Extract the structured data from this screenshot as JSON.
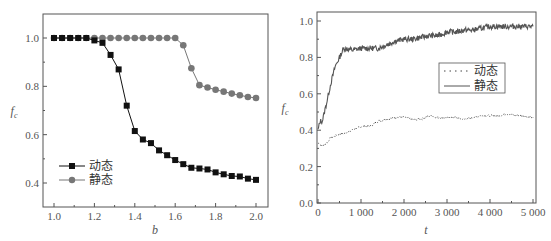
{
  "chart_data": [
    {
      "type": "line",
      "title": "",
      "xlabel": "b",
      "ylabel": "f_c",
      "xlim": [
        0.98,
        2.05
      ],
      "ylim": [
        0.3,
        1.1
      ],
      "xticks": [
        "1.0",
        "1.2",
        "1.4",
        "1.6",
        "1.8",
        "2.0"
      ],
      "yticks": [
        "0.4",
        "0.6",
        "0.8",
        "1.0"
      ],
      "grid": false,
      "legend_position": "lower left",
      "x": [
        1.0,
        1.04,
        1.08,
        1.12,
        1.16,
        1.2,
        1.24,
        1.28,
        1.32,
        1.36,
        1.4,
        1.44,
        1.48,
        1.52,
        1.56,
        1.6,
        1.64,
        1.68,
        1.72,
        1.76,
        1.8,
        1.84,
        1.88,
        1.92,
        1.96,
        2.0
      ],
      "series": [
        {
          "name": "动态",
          "marker": "square",
          "color": "#111111",
          "values": [
            1.0,
            1.0,
            1.0,
            1.0,
            1.0,
            0.99,
            0.98,
            0.93,
            0.87,
            0.72,
            0.615,
            0.58,
            0.565,
            0.535,
            0.515,
            0.495,
            0.478,
            0.463,
            0.46,
            0.456,
            0.444,
            0.436,
            0.429,
            0.427,
            0.418,
            0.413
          ]
        },
        {
          "name": "静态",
          "marker": "circle",
          "color": "#777777",
          "values": [
            1.0,
            1.0,
            1.0,
            1.0,
            1.0,
            1.0,
            1.0,
            1.0,
            1.0,
            1.0,
            1.0,
            1.0,
            1.0,
            1.0,
            1.0,
            1.0,
            0.97,
            0.875,
            0.805,
            0.795,
            0.786,
            0.778,
            0.77,
            0.763,
            0.756,
            0.752
          ]
        }
      ]
    },
    {
      "type": "line",
      "title": "",
      "xlabel": "t",
      "ylabel": "f_c",
      "xlim": [
        0,
        5000
      ],
      "ylim": [
        0.0,
        1.05
      ],
      "xticks": [
        "0",
        "1 000",
        "2 000",
        "3 000",
        "4 000",
        "5 000"
      ],
      "yticks": [
        "0.0",
        "0.2",
        "0.4",
        "0.6",
        "0.8",
        "1.0"
      ],
      "grid": false,
      "legend_position": "upper right (inside, boxed)",
      "x": [
        0,
        50,
        100,
        200,
        300,
        400,
        500,
        600,
        800,
        1000,
        1200,
        1400,
        1600,
        1800,
        2000,
        2200,
        2400,
        2600,
        2800,
        3000,
        3200,
        3400,
        3600,
        3800,
        4000,
        4200,
        4400,
        4600,
        4800,
        5000
      ],
      "series": [
        {
          "name": "动态",
          "style": "dotted",
          "color": "#444444",
          "values": [
            0.33,
            0.32,
            0.31,
            0.33,
            0.36,
            0.37,
            0.38,
            0.38,
            0.4,
            0.42,
            0.42,
            0.45,
            0.46,
            0.47,
            0.47,
            0.46,
            0.46,
            0.48,
            0.47,
            0.47,
            0.47,
            0.46,
            0.47,
            0.48,
            0.48,
            0.48,
            0.49,
            0.48,
            0.48,
            0.47
          ]
        },
        {
          "name": "静态",
          "style": "solid",
          "color": "#555555",
          "values": [
            0.4,
            0.45,
            0.45,
            0.55,
            0.66,
            0.75,
            0.8,
            0.85,
            0.84,
            0.85,
            0.85,
            0.85,
            0.87,
            0.89,
            0.9,
            0.9,
            0.91,
            0.92,
            0.92,
            0.94,
            0.94,
            0.95,
            0.95,
            0.96,
            0.97,
            0.97,
            0.97,
            0.97,
            0.97,
            0.97
          ]
        }
      ]
    }
  ],
  "left_chart": {
    "xlabel": "b",
    "ylabel": "f",
    "ylabel_sub": "c",
    "xticks": [
      "1.0",
      "1.2",
      "1.4",
      "1.6",
      "1.8",
      "2.0"
    ],
    "yticks": [
      "0.4",
      "0.6",
      "0.8",
      "1.0"
    ],
    "legend": [
      "动态",
      "静态"
    ]
  },
  "right_chart": {
    "xlabel": "t",
    "ylabel": "f",
    "ylabel_sub": "c",
    "xticks": [
      "0",
      "1 000",
      "2 000",
      "3 000",
      "4 000",
      "5 000"
    ],
    "yticks": [
      "0.0",
      "0.2",
      "0.4",
      "0.6",
      "0.8",
      "1.0"
    ],
    "legend": [
      "动态",
      "静态"
    ]
  }
}
